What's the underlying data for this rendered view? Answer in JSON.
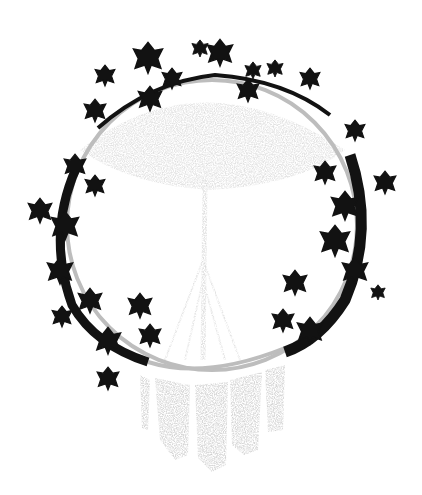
{
  "image": {
    "width": 422,
    "height": 495,
    "subject": "macrame hoop wreath with ivy",
    "background_color": "#ffffff",
    "hoop_color": "#bdbdbd",
    "leaf_color": "#111111",
    "fringe_color": "#c8c8c8"
  }
}
